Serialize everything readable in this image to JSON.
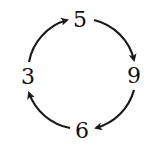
{
  "diagram": {
    "type": "cycle",
    "direction": "clockwise",
    "nodes": [
      {
        "id": "top",
        "label": "5",
        "x": 80,
        "y": 20
      },
      {
        "id": "right",
        "label": "9",
        "x": 134,
        "y": 76
      },
      {
        "id": "bottom",
        "label": "6",
        "x": 82,
        "y": 131
      },
      {
        "id": "left",
        "label": "3",
        "x": 28,
        "y": 77
      }
    ],
    "edges": [
      {
        "from": "3",
        "to": "5"
      },
      {
        "from": "5",
        "to": "9"
      },
      {
        "from": "9",
        "to": "6"
      },
      {
        "from": "6",
        "to": "3"
      }
    ],
    "colors": {
      "arrow": "#1a1a1a",
      "text": "#111111",
      "background": "#ffffff"
    }
  }
}
